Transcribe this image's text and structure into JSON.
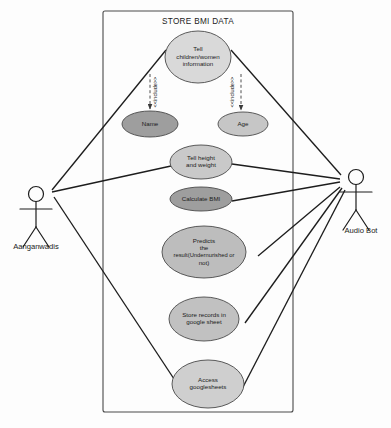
{
  "diagram": {
    "kind": "uml-use-case-diagram",
    "system_boundary": {
      "title": "STORE BMI DATA",
      "x": 103,
      "y": 11,
      "width": 190,
      "height": 401
    },
    "actors": [
      {
        "id": "aanganwadis",
        "label": "Aanganwadis",
        "side": "left",
        "x": 36,
        "y": 194,
        "label_x": 36,
        "label_y": 249
      },
      {
        "id": "audio-bot",
        "label": "Audio Bot",
        "side": "right",
        "x": 356,
        "y": 177,
        "label_x": 361,
        "label_y": 233
      }
    ],
    "use_cases": [
      {
        "id": "tell-children-women-information",
        "lines": [
          "Tell",
          "children/women",
          "information"
        ],
        "cx": 198,
        "cy": 57,
        "rx": 33,
        "ry": 26,
        "fill": "#d9d9d9"
      },
      {
        "id": "name",
        "lines": [
          "Name"
        ],
        "cx": 150,
        "cy": 124,
        "rx": 28,
        "ry": 13,
        "fill": "#9e9e9e"
      },
      {
        "id": "age",
        "lines": [
          "Age"
        ],
        "cx": 243,
        "cy": 124,
        "rx": 25,
        "ry": 12,
        "fill": "#c6c6c6"
      },
      {
        "id": "tell-height-and-weight",
        "lines": [
          "Tell height",
          "and weight"
        ],
        "cx": 201,
        "cy": 162,
        "rx": 31,
        "ry": 17,
        "fill": "#c9c9c9"
      },
      {
        "id": "calculate-bmi",
        "lines": [
          "Calculate BMI"
        ],
        "cx": 201,
        "cy": 199,
        "rx": 31,
        "ry": 12,
        "fill": "#9e9e9e"
      },
      {
        "id": "predicts-the-result",
        "lines": [
          "Predicts",
          "the",
          "result(Undernurished or",
          "not)"
        ],
        "cx": 204,
        "cy": 252,
        "rx": 42,
        "ry": 26,
        "fill": "#bdbdbd"
      },
      {
        "id": "store-records-in-google-sheet",
        "lines": [
          "Store records in",
          "google sheet"
        ],
        "cx": 204,
        "cy": 319,
        "rx": 35,
        "ry": 22,
        "fill": "#c1c1c1"
      },
      {
        "id": "access-googlesheets",
        "lines": [
          "Access",
          "googlesheets"
        ],
        "cx": 208,
        "cy": 384,
        "rx": 36,
        "ry": 24,
        "fill": "#cfcfcf"
      }
    ],
    "include_relations": [
      {
        "id": "include-name",
        "label": "<<include>>",
        "from": "tell-children-women-information",
        "to": "name",
        "x1": 150,
        "y1": 74,
        "x2": 150,
        "y2": 109,
        "label_x": 157,
        "label_y": 92
      },
      {
        "id": "include-age",
        "label": "<<include>>",
        "from": "tell-children-women-information",
        "to": "age",
        "x1": 241,
        "y1": 74,
        "x2": 241,
        "y2": 110,
        "label_x": 234,
        "label_y": 92
      }
    ],
    "associations": [
      {
        "id": "assoc-aanganwadis-tell-children",
        "from": "aanganwadis",
        "to": "tell-children-women-information",
        "x1": 52,
        "y1": 190,
        "x2": 166,
        "y2": 50
      },
      {
        "id": "assoc-aanganwadis-tell-height",
        "from": "aanganwadis",
        "to": "tell-height-and-weight",
        "x1": 52,
        "y1": 192,
        "x2": 171,
        "y2": 166
      },
      {
        "id": "assoc-aanganwadis-access-googlesheets",
        "from": "aanganwadis",
        "to": "access-googlesheets",
        "x1": 54,
        "y1": 197,
        "x2": 178,
        "y2": 385
      },
      {
        "id": "assoc-audiobot-tell-children",
        "from": "audio-bot",
        "to": "tell-children-women-information",
        "x1": 341,
        "y1": 175,
        "x2": 231,
        "y2": 50
      },
      {
        "id": "assoc-audiobot-tell-height",
        "from": "audio-bot",
        "to": "tell-height-and-weight",
        "x1": 340,
        "y1": 179,
        "x2": 232,
        "y2": 164
      },
      {
        "id": "assoc-audiobot-calculate-bmi",
        "from": "audio-bot",
        "to": "calculate-bmi",
        "x1": 340,
        "y1": 182,
        "x2": 232,
        "y2": 201
      },
      {
        "id": "assoc-audiobot-predicts",
        "from": "audio-bot",
        "to": "predicts-the-result",
        "x1": 340,
        "y1": 187,
        "x2": 258,
        "y2": 256
      },
      {
        "id": "assoc-audiobot-store-records",
        "from": "audio-bot",
        "to": "store-records-in-google-sheet",
        "x1": 342,
        "y1": 188,
        "x2": 245,
        "y2": 323
      },
      {
        "id": "assoc-audiobot-access-googlesheets",
        "from": "audio-bot",
        "to": "access-googlesheets",
        "x1": 345,
        "y1": 190,
        "x2": 243,
        "y2": 387
      }
    ]
  }
}
